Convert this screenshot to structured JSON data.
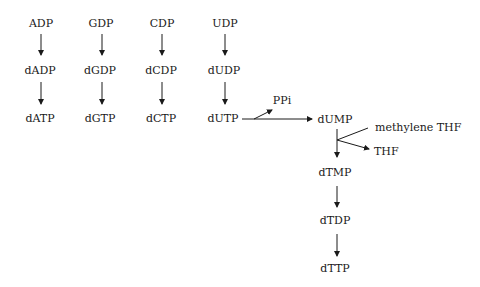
{
  "nodes": {
    "adp": "ADP",
    "gdp": "GDP",
    "cdp": "CDP",
    "udp": "UDP",
    "dadp": "dADP",
    "dgdp": "dGDP",
    "dcdp": "dCDP",
    "dudp": "dUDP",
    "datp": "dATP",
    "dgtp": "dGTP",
    "dctp": "dCTP",
    "dutp": "dUTP",
    "ppi": "PPi",
    "dump": "dUMP",
    "methylene_thf": "methylene THF",
    "thf": "THF",
    "dtmp": "dTMP",
    "dtdp": "dTDP",
    "dttp": "dTTP"
  },
  "edges": [
    [
      "ADP",
      "dADP"
    ],
    [
      "dADP",
      "dATP"
    ],
    [
      "GDP",
      "dGDP"
    ],
    [
      "dGDP",
      "dGTP"
    ],
    [
      "CDP",
      "dCDP"
    ],
    [
      "dCDP",
      "dCTP"
    ],
    [
      "UDP",
      "dUDP"
    ],
    [
      "dUDP",
      "dUTP"
    ],
    [
      "dUTP",
      "dUMP"
    ],
    [
      "dUTP",
      "PPi"
    ],
    [
      "dUMP",
      "dTMP"
    ],
    [
      "methylene THF",
      "THF"
    ],
    [
      "dTMP",
      "dTDP"
    ],
    [
      "dTDP",
      "dTTP"
    ]
  ]
}
